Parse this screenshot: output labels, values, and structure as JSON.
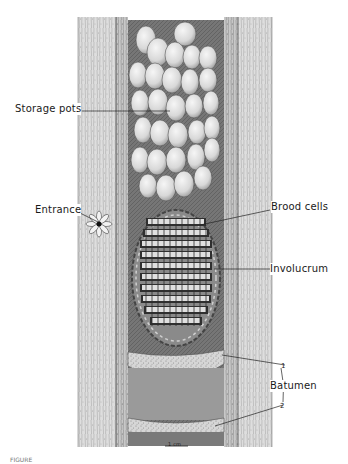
{
  "figure": {
    "labels": {
      "storage_pots": "Storage pots",
      "entrance": "Entrance",
      "brood_cells": "Brood cells",
      "involucrum": "Involucrum",
      "batumen": "Batumen",
      "batumen_marker_1": "1",
      "batumen_marker_2": "2"
    },
    "scale_bar": "1 cm",
    "caption": "FIGURE"
  },
  "colors": {
    "ink": "#1a1a1a",
    "wood_light": "#d9d9d9",
    "wood_mid": "#bdbdbd",
    "cavity_dark": "#6e6e6e",
    "pot_fill": "#ececec",
    "brood_dark": "#3a3a3a",
    "batumen": "#cfcfcf"
  }
}
